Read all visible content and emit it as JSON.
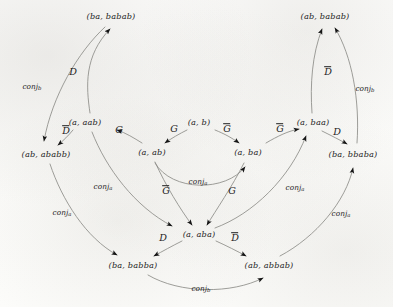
{
  "diagram": {
    "type": "directed-graph",
    "title": "",
    "nodes": [
      {
        "id": "ba_babab",
        "label": "(ba, babab)",
        "x": 111,
        "y": 16
      },
      {
        "id": "ab_babab",
        "label": "(ab, babab)",
        "x": 325,
        "y": 16
      },
      {
        "id": "a_aab",
        "label": "(a, aab)",
        "x": 85,
        "y": 122
      },
      {
        "id": "a_baa",
        "label": "(a, baa)",
        "x": 313,
        "y": 122
      },
      {
        "id": "a_b",
        "label": "(a, b)",
        "x": 199,
        "y": 122
      },
      {
        "id": "ab_ababb",
        "label": "(ab, ababb)",
        "x": 46,
        "y": 154
      },
      {
        "id": "ba_bbaba",
        "label": "(ba, bbaba)",
        "x": 353,
        "y": 154
      },
      {
        "id": "a_ab",
        "label": "(a, ab)",
        "x": 152,
        "y": 152
      },
      {
        "id": "a_ba",
        "label": "(a, ba)",
        "x": 248,
        "y": 152
      },
      {
        "id": "a_aba",
        "label": "(a, aba)",
        "x": 199,
        "y": 234
      },
      {
        "id": "ba_babba",
        "label": "(ba, babba)",
        "x": 133,
        "y": 265
      },
      {
        "id": "ab_abbab",
        "label": "(ab, abbab)",
        "x": 269,
        "y": 265
      }
    ],
    "edges": [
      {
        "id": "e1",
        "from": "ab_ababb",
        "to": "ba_babab",
        "label": "conj",
        "sub": "b",
        "kind": "conj",
        "lx": 32,
        "ly": 87
      },
      {
        "id": "e2",
        "from": "a_aab",
        "to": "ba_babab",
        "label": "D",
        "sub": "",
        "kind": "fn",
        "lx": 73,
        "ly": 72
      },
      {
        "id": "e3",
        "from": "a_aab",
        "to": "ab_ababb",
        "label": "D",
        "sub": "",
        "kind": "fn",
        "overline": true,
        "lx": 66,
        "ly": 131
      },
      {
        "id": "e4",
        "from": "a_ab",
        "to": "a_aab",
        "label": "G",
        "sub": "",
        "kind": "fn",
        "lx": 119,
        "ly": 130
      },
      {
        "id": "e5",
        "from": "a_b",
        "to": "a_ab",
        "label": "G",
        "sub": "",
        "kind": "fn",
        "lx": 174,
        "ly": 129
      },
      {
        "id": "e6",
        "from": "a_b",
        "to": "a_ba",
        "label": "G",
        "sub": "",
        "kind": "fn",
        "overline": true,
        "lx": 227,
        "ly": 129
      },
      {
        "id": "e7",
        "from": "a_ba",
        "to": "a_baa",
        "label": "G",
        "sub": "",
        "kind": "fn",
        "overline": true,
        "lx": 280,
        "ly": 129
      },
      {
        "id": "e8",
        "from": "a_baa",
        "to": "ab_babab",
        "label": "D",
        "sub": "",
        "kind": "fn",
        "overline": true,
        "lx": 328,
        "ly": 72
      },
      {
        "id": "e9",
        "from": "ba_bbaba",
        "to": "ab_babab",
        "label": "conj",
        "sub": "b",
        "kind": "conj",
        "lx": 365,
        "ly": 89
      },
      {
        "id": "e10",
        "from": "a_baa",
        "to": "ba_bbaba",
        "label": "D",
        "sub": "",
        "kind": "fn",
        "lx": 337,
        "ly": 132
      },
      {
        "id": "e11",
        "from": "a_aab",
        "to": "a_aba",
        "label": "conj",
        "sub": "a",
        "kind": "conj",
        "lx": 103,
        "ly": 187
      },
      {
        "id": "e12",
        "from": "ab_ababb",
        "to": "ba_babba",
        "label": "conj",
        "sub": "a",
        "kind": "conj",
        "lx": 62,
        "ly": 213
      },
      {
        "id": "e13",
        "from": "a_ab",
        "to": "a_aba",
        "label": "G",
        "sub": "",
        "kind": "fn",
        "overline": true,
        "lx": 166,
        "ly": 191
      },
      {
        "id": "e14",
        "from": "a_ab",
        "to": "a_ba",
        "label": "conj",
        "sub": "a",
        "kind": "conj",
        "lx": 198,
        "ly": 182
      },
      {
        "id": "e15",
        "from": "a_ba",
        "to": "a_aba",
        "label": "G",
        "sub": "",
        "kind": "fn",
        "lx": 232,
        "ly": 191
      },
      {
        "id": "e16",
        "from": "a_aba",
        "to": "a_baa",
        "label": "conj",
        "sub": "a",
        "kind": "conj",
        "lx": 295,
        "ly": 188
      },
      {
        "id": "e17",
        "from": "ab_abbab",
        "to": "ba_bbaba",
        "label": "conj",
        "sub": "a",
        "kind": "conj",
        "lx": 341,
        "ly": 214
      },
      {
        "id": "e18",
        "from": "a_aba",
        "to": "ba_babba",
        "label": "D",
        "sub": "",
        "kind": "fn",
        "lx": 163,
        "ly": 238
      },
      {
        "id": "e19",
        "from": "a_aba",
        "to": "ab_abbab",
        "label": "D",
        "sub": "",
        "kind": "fn",
        "overline": true,
        "lx": 235,
        "ly": 238
      },
      {
        "id": "e20",
        "from": "ba_babba",
        "to": "ab_abbab",
        "label": "conj",
        "sub": "b",
        "kind": "conj",
        "lx": 201,
        "ly": 289
      }
    ],
    "colors": {
      "stroke": "#8c8c88",
      "arrowhead": "#151515",
      "text": "#1d1d1d",
      "background": "#fdfdfc"
    }
  }
}
